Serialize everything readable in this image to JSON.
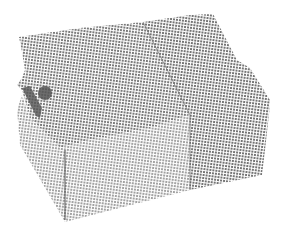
{
  "image": {
    "subject": "halftone-rendered 3D box object",
    "background": "#ffffff",
    "colors": {
      "top_face_dot": "#7a7a7a",
      "front_face_dot": "#9a9a9a",
      "right_face_dot": "#6e6e6e",
      "handle": "#555555",
      "edge": "#4a4a4a"
    }
  }
}
